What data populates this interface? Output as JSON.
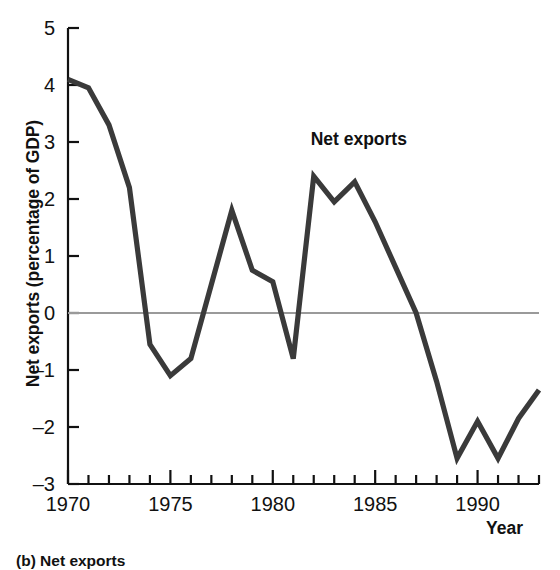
{
  "figure": {
    "caption": "(b) Net exports",
    "annotation_label": "Net exports",
    "line_color": "#3a3a3a",
    "zero_line_color": "#9a9a9a",
    "axis_color": "#111111",
    "background_color": "#ffffff"
  },
  "chart_data": {
    "type": "line",
    "title": "",
    "xlabel": "Year",
    "ylabel": "Net exports (percentage of GDP)",
    "xlim": [
      1970,
      1993
    ],
    "ylim": [
      -3,
      5
    ],
    "xticks": [
      1970,
      1975,
      1980,
      1985,
      1990
    ],
    "xtick_labels": [
      "1970",
      "1975",
      "1980",
      "1985",
      "1990"
    ],
    "yticks": [
      -3,
      -2,
      -1,
      0,
      1,
      2,
      3,
      4,
      5
    ],
    "ytick_labels": [
      "-3",
      "-2",
      "-1",
      "0",
      "1",
      "2",
      "3",
      "4",
      "5"
    ],
    "minor_xtick_step": 1,
    "grid": false,
    "legend": "none",
    "zero_reference_line": 0,
    "annotations": [
      {
        "text": "Net exports",
        "x": 1984.2,
        "y": 2.95
      }
    ],
    "series": [
      {
        "name": "Net exports",
        "x": [
          1970,
          1971,
          1972,
          1973,
          1974,
          1975,
          1976,
          1977,
          1978,
          1979,
          1980,
          1981,
          1982,
          1983,
          1984,
          1985,
          1986,
          1987,
          1988,
          1989,
          1990,
          1991,
          1992,
          1993
        ],
        "values": [
          4.1,
          3.95,
          3.3,
          2.2,
          -0.55,
          -1.1,
          -0.8,
          0.5,
          1.8,
          0.75,
          0.55,
          -0.8,
          2.4,
          1.95,
          2.3,
          1.6,
          0.8,
          0.0,
          -1.2,
          -2.55,
          -1.9,
          -2.55,
          -1.85,
          -1.35
        ]
      }
    ]
  }
}
